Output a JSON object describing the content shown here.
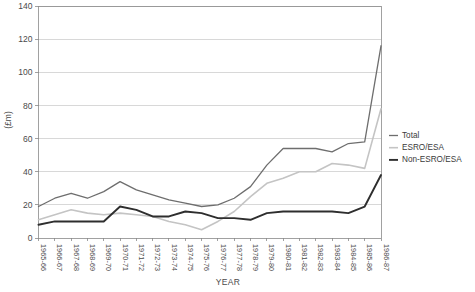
{
  "chart_data": {
    "type": "line",
    "title": "",
    "xlabel": "YEAR",
    "ylabel": "(£m)",
    "ylim": [
      0,
      140
    ],
    "ytick_step": 20,
    "yticks": [
      0,
      20,
      40,
      60,
      80,
      100,
      120,
      140
    ],
    "grid": true,
    "legend_position": "right-middle",
    "categories": [
      "1965-66",
      "1966-67",
      "1967-68",
      "1968-69",
      "1969-70",
      "1970-71",
      "1971-72",
      "1972-73",
      "1973-74",
      "1974-75",
      "1975-76",
      "1976-77",
      "1977-78",
      "1978-79",
      "1979-80",
      "1980-81",
      "1981-82",
      "1982-83",
      "1983-84",
      "1984-85",
      "1985-86",
      "1986-87"
    ],
    "series": [
      {
        "name": "Total",
        "color": "#6e6e6e",
        "width": 1.3,
        "values": [
          19,
          24,
          27,
          24,
          28,
          34,
          29,
          26,
          23,
          21,
          19,
          20,
          24,
          31,
          44,
          54,
          54,
          54,
          52,
          57,
          58,
          116
        ]
      },
      {
        "name": "ESRO/ESA",
        "color": "#c4c4c4",
        "width": 1.6,
        "values": [
          11,
          14,
          17,
          15,
          14,
          15,
          14,
          13,
          10,
          8,
          5,
          10,
          16,
          25,
          33,
          36,
          40,
          40,
          45,
          44,
          42,
          78
        ]
      },
      {
        "name": "Non-ESRO/ESA",
        "color": "#2e2e2e",
        "width": 1.9,
        "values": [
          8,
          10,
          10,
          10,
          10,
          19,
          17,
          13,
          13,
          16,
          15,
          12,
          12,
          11,
          15,
          16,
          16,
          16,
          16,
          15,
          19,
          38
        ]
      }
    ]
  },
  "legend": {
    "items": [
      {
        "label": "Total"
      },
      {
        "label": "ESRO/ESA"
      },
      {
        "label": "Non-ESRO/ESA"
      }
    ]
  }
}
